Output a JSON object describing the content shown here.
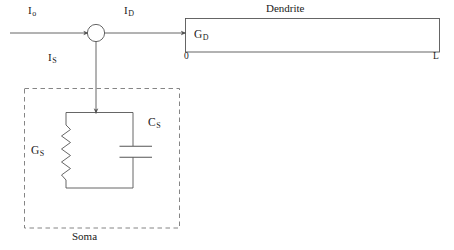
{
  "diagram": {
    "stroke_color": "#555555",
    "text_color": "#1a1a1a",
    "background": "#ffffff"
  },
  "labels": {
    "input_current": "I",
    "input_current_sub": "o",
    "dendritic_current": "I",
    "dendritic_current_sub": "D",
    "somatic_current": "I",
    "somatic_current_sub": "S",
    "dendrite_conductance": "G",
    "dendrite_conductance_sub": "D",
    "dendrite_title": "Dendrite",
    "dendrite_x_start": "0",
    "dendrite_x_end": "L",
    "soma_conductance": "G",
    "soma_conductance_sub": "S",
    "soma_capacitance": "C",
    "soma_capacitance_sub": "S",
    "soma_title": "Soma"
  },
  "components": {
    "junction_node": "current-summing-node",
    "resistor": "soma-leak-conductance-resistor",
    "capacitor": "soma-membrane-capacitor",
    "dendrite_cable": "dendrite-cable-box",
    "soma_boundary": "soma-dashed-boundary"
  }
}
